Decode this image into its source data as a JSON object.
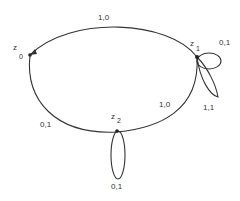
{
  "diagram": {
    "type": "state-transition-diagram",
    "nodes": [
      {
        "id": "z0",
        "letter": "z",
        "index": "0"
      },
      {
        "id": "z1",
        "letter": "z",
        "index": "1"
      },
      {
        "id": "z2",
        "letter": "z",
        "index": "2"
      }
    ],
    "edges": [
      {
        "from": "z1",
        "to": "z0",
        "label": "1,0"
      },
      {
        "from": "z0",
        "to": "z2",
        "label": "0,1"
      },
      {
        "from": "z2",
        "to": "z1",
        "label": "1,0"
      },
      {
        "from": "z1",
        "to": "z1",
        "label": "0,1"
      },
      {
        "from": "z1",
        "to": "z1",
        "label": "1,1"
      },
      {
        "from": "z2",
        "to": "z2",
        "label": "0,1"
      }
    ]
  }
}
